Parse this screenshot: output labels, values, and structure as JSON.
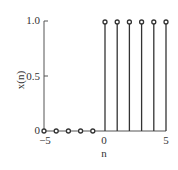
{
  "chart_data": {
    "type": "stem",
    "title": "",
    "xlabel": "n",
    "ylabel": "x(n)",
    "x": [
      -5,
      -4,
      -3,
      -2,
      -1,
      0,
      1,
      2,
      3,
      4,
      5
    ],
    "values": [
      0,
      0,
      0,
      0,
      0,
      1,
      1,
      1,
      1,
      1,
      1
    ],
    "xlim": [
      -5,
      5
    ],
    "ylim": [
      0,
      1.0
    ],
    "xticks": [
      "-5",
      "0",
      "5"
    ],
    "yticks": [
      "0",
      "0.5",
      "1.0"
    ],
    "grid": false,
    "legend": null,
    "colors": {
      "stem": "#333333",
      "axis": "#555555"
    }
  },
  "labels": {
    "xlabel": "n",
    "ylabel": "x(n)",
    "xtick_neg5": "−5",
    "xtick_0": "0",
    "xtick_5": "5",
    "ytick_0": "0",
    "ytick_05": "0.5",
    "ytick_1": "1.0"
  }
}
